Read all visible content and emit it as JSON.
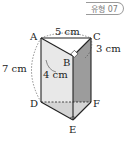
{
  "badge": {
    "label": "유형 07"
  },
  "diagram": {
    "type": "triangular-prism",
    "vertices": {
      "A": "A",
      "B": "B",
      "C": "C",
      "D": "D",
      "E": "E",
      "F": "F"
    },
    "measurements": {
      "AC": "5 cm",
      "BC": "3 cm",
      "AB": "4 cm",
      "height": "7 cm"
    },
    "right_angles": [
      "B",
      "E"
    ],
    "colors": {
      "light_face": "#e6e6e6",
      "dark_face": "#9a9a9a",
      "bottom_face": "#d0d0d0",
      "edge": "#222222"
    }
  }
}
